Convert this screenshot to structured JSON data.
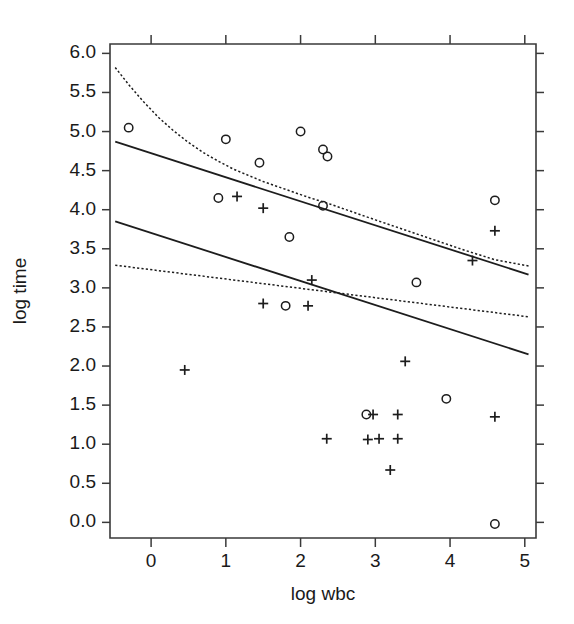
{
  "chart_data": {
    "type": "scatter",
    "title": "",
    "xlabel": "log wbc",
    "ylabel": "log time",
    "xlim": [
      -0.55,
      5.15
    ],
    "ylim": [
      -0.2,
      6.12
    ],
    "xticks": [
      0,
      1,
      2,
      3,
      4,
      5
    ],
    "xtick_labels": [
      "0",
      "1",
      "2",
      "3",
      "4",
      "5"
    ],
    "yticks": [
      0.0,
      0.5,
      1.0,
      1.5,
      2.0,
      2.5,
      3.0,
      3.5,
      4.0,
      4.5,
      5.0,
      5.5,
      6.0
    ],
    "ytick_labels": [
      "0.0",
      "0.5",
      "1.0",
      "1.5",
      "2.0",
      "2.5",
      "3.0",
      "3.5",
      "4.0",
      "4.5",
      "5.0",
      "5.5",
      "6.0"
    ],
    "grid": false,
    "legend": null,
    "series": [
      {
        "name": "circle-group",
        "marker": "circle",
        "color": "#1d1d1d",
        "points": [
          {
            "x": -0.3,
            "y": 5.05
          },
          {
            "x": 1.0,
            "y": 4.9
          },
          {
            "x": 2.0,
            "y": 5.0
          },
          {
            "x": 2.3,
            "y": 4.77
          },
          {
            "x": 2.36,
            "y": 4.68
          },
          {
            "x": 1.45,
            "y": 4.6
          },
          {
            "x": 0.9,
            "y": 4.15
          },
          {
            "x": 2.3,
            "y": 4.05
          },
          {
            "x": 4.6,
            "y": 4.12
          },
          {
            "x": 1.85,
            "y": 3.65
          },
          {
            "x": 3.55,
            "y": 3.07
          },
          {
            "x": 1.8,
            "y": 2.77
          },
          {
            "x": 3.95,
            "y": 1.58
          },
          {
            "x": 2.88,
            "y": 1.38
          },
          {
            "x": 4.6,
            "y": -0.02
          }
        ]
      },
      {
        "name": "plus-group",
        "marker": "plus",
        "color": "#1d1d1d",
        "points": [
          {
            "x": 1.15,
            "y": 4.17
          },
          {
            "x": 1.5,
            "y": 4.02
          },
          {
            "x": 4.6,
            "y": 3.73
          },
          {
            "x": 4.3,
            "y": 3.35
          },
          {
            "x": 2.15,
            "y": 3.1
          },
          {
            "x": 1.5,
            "y": 2.8
          },
          {
            "x": 2.1,
            "y": 2.77
          },
          {
            "x": 3.4,
            "y": 2.06
          },
          {
            "x": 0.45,
            "y": 1.95
          },
          {
            "x": 2.97,
            "y": 1.38
          },
          {
            "x": 3.3,
            "y": 1.38
          },
          {
            "x": 4.6,
            "y": 1.35
          },
          {
            "x": 2.35,
            "y": 1.07
          },
          {
            "x": 3.05,
            "y": 1.07
          },
          {
            "x": 3.3,
            "y": 1.07
          },
          {
            "x": 2.9,
            "y": 1.06
          },
          {
            "x": 3.2,
            "y": 0.67
          }
        ]
      }
    ],
    "fitted_lines": [
      {
        "name": "upper-solid-line",
        "style": "solid",
        "color": "#1d1d1d",
        "endpoints": [
          {
            "x": -0.48,
            "y": 4.87
          },
          {
            "x": 5.05,
            "y": 3.17
          }
        ]
      },
      {
        "name": "lower-solid-line",
        "style": "solid",
        "color": "#1d1d1d",
        "endpoints": [
          {
            "x": -0.48,
            "y": 3.85
          },
          {
            "x": 5.05,
            "y": 2.15
          }
        ]
      },
      {
        "name": "lower-dashed-line",
        "style": "dashed",
        "color": "#1d1d1d",
        "endpoints": [
          {
            "x": -0.48,
            "y": 3.29
          },
          {
            "x": 5.05,
            "y": 2.63
          }
        ]
      }
    ],
    "fitted_curves": [
      {
        "name": "upper-dashed-curve",
        "style": "dashed",
        "color": "#1d1d1d",
        "points": [
          {
            "x": -0.48,
            "y": 5.82
          },
          {
            "x": -0.3,
            "y": 5.6
          },
          {
            "x": -0.1,
            "y": 5.38
          },
          {
            "x": 0.1,
            "y": 5.18
          },
          {
            "x": 0.3,
            "y": 5.01
          },
          {
            "x": 0.5,
            "y": 4.86
          },
          {
            "x": 0.7,
            "y": 4.73
          },
          {
            "x": 0.9,
            "y": 4.62
          },
          {
            "x": 1.1,
            "y": 4.52
          },
          {
            "x": 1.3,
            "y": 4.44
          },
          {
            "x": 1.5,
            "y": 4.36
          },
          {
            "x": 1.8,
            "y": 4.26
          },
          {
            "x": 2.1,
            "y": 4.16
          },
          {
            "x": 2.4,
            "y": 4.07
          },
          {
            "x": 2.7,
            "y": 3.97
          },
          {
            "x": 3.0,
            "y": 3.87
          },
          {
            "x": 3.4,
            "y": 3.74
          },
          {
            "x": 3.8,
            "y": 3.61
          },
          {
            "x": 4.2,
            "y": 3.48
          },
          {
            "x": 4.6,
            "y": 3.36
          },
          {
            "x": 5.05,
            "y": 3.28
          }
        ]
      }
    ]
  }
}
